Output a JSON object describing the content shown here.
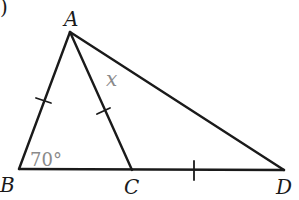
{
  "figure": {
    "part_marker": ")",
    "points": {
      "A": {
        "label": "A",
        "x": 70,
        "y": 32
      },
      "B": {
        "label": "B",
        "x": 19,
        "y": 169
      },
      "C": {
        "label": "C",
        "x": 132,
        "y": 170
      },
      "D": {
        "label": "D",
        "x": 284,
        "y": 170
      }
    },
    "segments": [
      "AB",
      "AC",
      "AD",
      "BD"
    ],
    "equal_marks": [
      "AB",
      "AC",
      "CD"
    ],
    "angle_label": "70°",
    "angle_at": "B",
    "unknown_label": "x",
    "unknown_at": "angle CAD",
    "line_color": "#1a1a1a",
    "annotation_color": "#8a8a8a"
  }
}
